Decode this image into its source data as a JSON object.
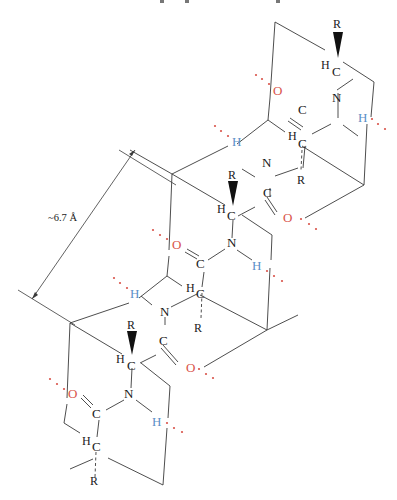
{
  "figure": {
    "type": "chemical-structure",
    "measurement": {
      "label": "~6.7 Å"
    },
    "colors": {
      "oxygen": "#d9534a",
      "hydrogen_bond_h": "#5b8fc7",
      "hbond_dots": "#d9534a",
      "bonds": "#3a3a3a",
      "text": "#1a1a1a"
    },
    "atoms": {
      "r1": "R",
      "h1": "H",
      "c1": "C",
      "o1": "O",
      "n1": "N",
      "c2": "C",
      "hb1": "H",
      "hb2": "H",
      "n2": "N",
      "h2": "H",
      "c3": "C",
      "r2": "R",
      "r3": "R",
      "h3": "H",
      "c4": "C",
      "c5": "C",
      "o2": "O",
      "o3": "O",
      "n3": "N",
      "hb3": "H",
      "c6": "C",
      "hb4": "H",
      "n4": "N",
      "h4": "H",
      "c7": "C",
      "r4": "R",
      "r5": "R",
      "h5": "H",
      "c8": "C",
      "c9": "C",
      "o4": "O",
      "o5": "O",
      "n5": "N",
      "hb5": "H",
      "c10": "C",
      "h6": "H",
      "c11": "C",
      "r6": "R"
    }
  }
}
